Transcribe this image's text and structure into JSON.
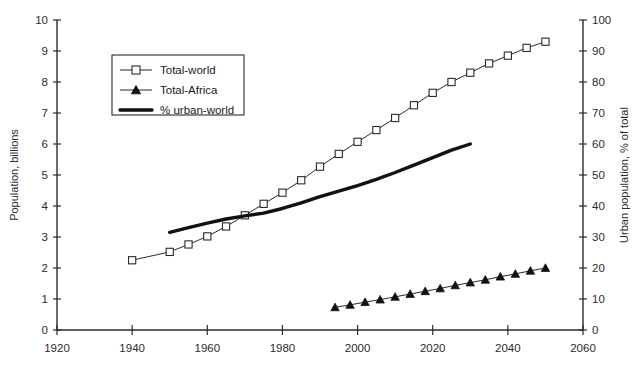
{
  "chart_data": {
    "type": "line",
    "title": "",
    "xlabel": "",
    "ylabel": "Population, billions",
    "y2label": "Urban population, % of total",
    "xlim": [
      1920,
      2060
    ],
    "ylim": [
      0,
      10
    ],
    "y2lim": [
      0,
      100
    ],
    "grid": false,
    "legend_position": "upper-left-inside",
    "xticks": [
      "1920",
      "1940",
      "1960",
      "1980",
      "2000",
      "2020",
      "2040",
      "2060"
    ],
    "xtick_values": [
      1920,
      1940,
      1960,
      1980,
      2000,
      2020,
      2040,
      2060
    ],
    "yticks": [
      "0",
      "1",
      "2",
      "3",
      "4",
      "5",
      "6",
      "7",
      "8",
      "9",
      "10"
    ],
    "ytick_values": [
      0,
      1,
      2,
      3,
      4,
      5,
      6,
      7,
      8,
      9,
      10
    ],
    "y2ticks": [
      "0",
      "10",
      "20",
      "30",
      "40",
      "50",
      "60",
      "70",
      "80",
      "90",
      "100"
    ],
    "y2tick_values": [
      0,
      10,
      20,
      30,
      40,
      50,
      60,
      70,
      80,
      90,
      100
    ],
    "series": [
      {
        "name": "Total-world",
        "axis": "left",
        "marker": "open-square",
        "line": "thin",
        "units": "billions",
        "x": [
          1940,
          1950,
          1955,
          1960,
          1965,
          1970,
          1975,
          1980,
          1985,
          1990,
          1995,
          2000,
          2005,
          2010,
          2015,
          2020,
          2025,
          2030,
          2035,
          2040,
          2045,
          2050
        ],
        "values": [
          2.25,
          2.52,
          2.76,
          3.02,
          3.34,
          3.7,
          4.07,
          4.43,
          4.83,
          5.27,
          5.68,
          6.07,
          6.45,
          6.84,
          7.25,
          7.65,
          8.0,
          8.3,
          8.6,
          8.85,
          9.1,
          9.3
        ]
      },
      {
        "name": "Total-Africa",
        "axis": "left",
        "marker": "filled-triangle",
        "line": "thin",
        "units": "billions",
        "x": [
          1994,
          1998,
          2002,
          2006,
          2010,
          2014,
          2018,
          2022,
          2026,
          2030,
          2034,
          2038,
          2042,
          2046,
          2050
        ],
        "values": [
          0.73,
          0.81,
          0.9,
          0.98,
          1.07,
          1.16,
          1.25,
          1.34,
          1.44,
          1.53,
          1.62,
          1.72,
          1.81,
          1.91,
          2.0
        ]
      },
      {
        "name": "% urban-world",
        "axis": "right",
        "marker": "none",
        "line": "thick",
        "units": "% of total",
        "x": [
          1950,
          1955,
          1960,
          1965,
          1970,
          1975,
          1980,
          1985,
          1990,
          1995,
          2000,
          2005,
          2010,
          2015,
          2020,
          2025,
          2030
        ],
        "values": [
          31.5,
          33.0,
          34.5,
          35.8,
          36.8,
          37.7,
          39.2,
          41.0,
          43.0,
          44.8,
          46.6,
          48.6,
          50.8,
          53.2,
          55.6,
          58.0,
          60.0
        ]
      }
    ]
  },
  "legend": {
    "items": [
      {
        "label": "Total-world",
        "marker": "open-square"
      },
      {
        "label": "Total-Africa",
        "marker": "filled-triangle"
      },
      {
        "label": "% urban-world",
        "marker": "thick-line"
      }
    ]
  }
}
